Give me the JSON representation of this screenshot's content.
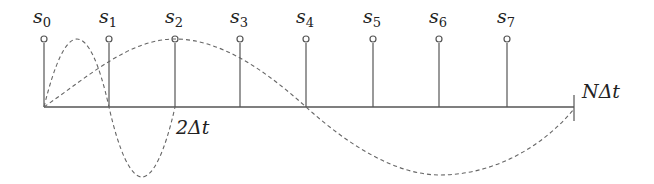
{
  "diagram": {
    "samples": [
      {
        "label": "s",
        "sub": "0",
        "x": 44
      },
      {
        "label": "s",
        "sub": "1",
        "x": 109
      },
      {
        "label": "s",
        "sub": "2",
        "x": 175
      },
      {
        "label": "s",
        "sub": "3",
        "x": 240
      },
      {
        "label": "s",
        "sub": "4",
        "x": 306
      },
      {
        "label": "s",
        "sub": "5",
        "x": 373
      },
      {
        "label": "s",
        "sub": "6",
        "x": 439
      },
      {
        "label": "s",
        "sub": "7",
        "x": 507
      }
    ],
    "axis_end_label": "NΔt",
    "period_label": "2Δt",
    "colors": {
      "line": "#555555",
      "dash": "#666666",
      "text": "#222222"
    }
  }
}
